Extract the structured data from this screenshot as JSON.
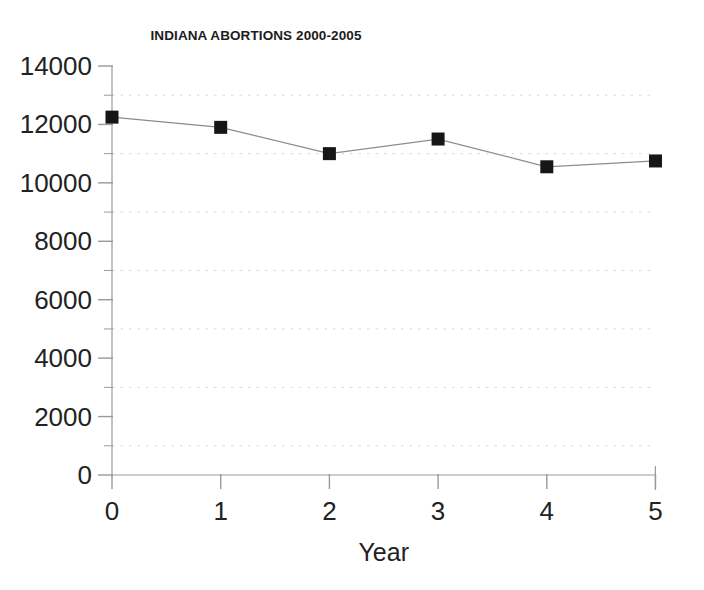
{
  "chart_data": {
    "type": "line",
    "title": "INDIANA ABORTIONS 2000-2005",
    "xlabel": "Year",
    "ylabel": "",
    "x": [
      0,
      1,
      2,
      3,
      4,
      5
    ],
    "values": [
      12250,
      11900,
      11000,
      11500,
      10550,
      10750
    ],
    "series": [
      {
        "name": "Indiana abortions",
        "values": [
          12250,
          11900,
          11000,
          11500,
          10550,
          10750
        ]
      }
    ],
    "xlim": [
      0,
      5
    ],
    "ylim": [
      0,
      14000
    ],
    "x_ticks": [
      0,
      1,
      2,
      3,
      4,
      5
    ],
    "x_tick_labels": [
      "0",
      "1",
      "2",
      "3",
      "4",
      "5"
    ],
    "y_ticks": [
      0,
      2000,
      4000,
      6000,
      8000,
      10000,
      12000,
      14000
    ],
    "y_tick_labels": [
      "0",
      "2000",
      "4000",
      "6000",
      "8000",
      "10000",
      "12000",
      "14000"
    ],
    "y_minor_ticks": [
      1000,
      3000,
      5000,
      7000,
      9000,
      11000,
      13000
    ],
    "grid": true,
    "grid_orientation": "horizontal",
    "grid_style": "dotted",
    "grid_at": [
      1000,
      3000,
      5000,
      7000,
      9000,
      11000,
      13000
    ],
    "legend": null,
    "legend_position": "none",
    "marker": "square",
    "marker_color": "#161616",
    "line_color": "#8c8c8c",
    "axis_color": "#999999",
    "grid_color": "#d8d8d8",
    "background": "#ffffff",
    "annotations": []
  }
}
